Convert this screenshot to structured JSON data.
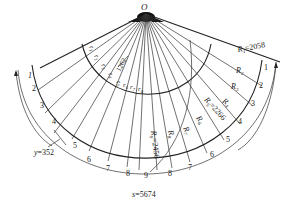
{
  "diagram": {
    "type": "fan-shaped sector layout",
    "center_label": "O",
    "inner_radii_labels": [
      "r1",
      "r2",
      "r3",
      "r4",
      "r5",
      "r6",
      "r7",
      "r8"
    ],
    "inner_dimension": "1262",
    "outer_radii": [
      {
        "label": "R1",
        "value": "2058"
      },
      {
        "label": "R2",
        "value": ""
      },
      {
        "label": "R3",
        "value": ""
      },
      {
        "label": "R4",
        "value": ""
      },
      {
        "label": "R5",
        "value": "2266"
      },
      {
        "label": "R6",
        "value": ""
      },
      {
        "label": "R7",
        "value": ""
      },
      {
        "label": "R8",
        "value": ""
      },
      {
        "label": "R9",
        "value": "2456"
      }
    ],
    "left_segment_numbers": [
      "1",
      "2",
      "3",
      "4",
      "5",
      "6",
      "7",
      "8",
      "9"
    ],
    "right_segment_numbers": [
      "1",
      "2",
      "3",
      "4",
      "5",
      "6",
      "7",
      "8"
    ],
    "y_dimension": "y=352",
    "s_dimension": "s=5674",
    "labels": {
      "O": "O",
      "R1_text": "R",
      "R1_sub": "1",
      "R1_val": "=2058",
      "R2_text": "R",
      "R2_sub": "2",
      "R3_text": "R",
      "R3_sub": "3",
      "R4_text": "R",
      "R4_sub": "4",
      "R5_text": "R",
      "R5_sub": "5",
      "R5_val": "=2266",
      "R6_text": "R",
      "R6_sub": "6",
      "R7_text": "R",
      "R7_sub": "7",
      "R8_text": "R",
      "R8_sub": "8",
      "R9_text": "R",
      "R9_sub": "9",
      "R9_val": "=2456",
      "r_text": "r",
      "r1_sub": "1",
      "r2_sub": "2",
      "r3_sub": "3",
      "r4_sub": "4",
      "r5_sub": "5",
      "r6_sub": "6",
      "r7_sub": "7",
      "r8_sub": "8",
      "dim_1262": "1262",
      "y_label": "y",
      "y_val": "=352",
      "s_label": "s",
      "s_val": "=5674"
    }
  }
}
